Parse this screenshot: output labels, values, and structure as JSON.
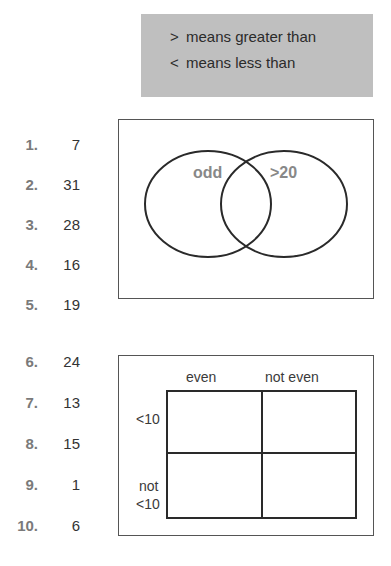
{
  "key": {
    "lines": [
      {
        "symbol": ">",
        "text": "means greater than"
      },
      {
        "symbol": "<",
        "text": "means less than"
      }
    ]
  },
  "questions_part1": [
    {
      "number": "1.",
      "value": "7"
    },
    {
      "number": "2.",
      "value": "31"
    },
    {
      "number": "3.",
      "value": "28"
    },
    {
      "number": "4.",
      "value": "16"
    },
    {
      "number": "5.",
      "value": "19"
    }
  ],
  "questions_part2": [
    {
      "number": "6.",
      "value": "24"
    },
    {
      "number": "7.",
      "value": "13"
    },
    {
      "number": "8.",
      "value": "15"
    },
    {
      "number": "9.",
      "value": "1"
    },
    {
      "number": "10.",
      "value": "6"
    }
  ],
  "venn": {
    "left_label": "odd",
    "right_label": ">20"
  },
  "carroll": {
    "col_headers": [
      "even",
      "not even"
    ],
    "row_headers": [
      "<10",
      "not",
      "<10"
    ]
  }
}
